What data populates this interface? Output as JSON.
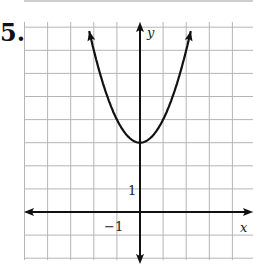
{
  "problem": {
    "number": "5."
  },
  "chart_data": {
    "type": "line",
    "title": "",
    "xlabel": "x",
    "ylabel": "y",
    "function": "y = x^2 + 3",
    "vertex": [
      0,
      3
    ],
    "grid": true,
    "xlim": [
      -5,
      5
    ],
    "ylim": [
      -2,
      8.2
    ],
    "tick_labels": [
      {
        "axis": "x",
        "value": -1,
        "text": "−1"
      },
      {
        "axis": "y",
        "value": 1,
        "text": "1"
      }
    ],
    "series": [
      {
        "name": "parabola",
        "x": [
          -2.2,
          -2,
          -1.5,
          -1,
          -0.5,
          0,
          0.5,
          1,
          1.5,
          2,
          2.2
        ],
        "y": [
          7.84,
          7,
          5.25,
          4,
          3.25,
          3,
          3.25,
          4,
          5.25,
          7,
          7.84
        ]
      }
    ],
    "colors": {
      "grid": "#b5b5b5",
      "axis": "#111111",
      "curve": "#111111"
    }
  },
  "labels": {
    "x_axis": "x",
    "y_axis": "y",
    "x_tick": "−1",
    "y_tick": "1"
  }
}
